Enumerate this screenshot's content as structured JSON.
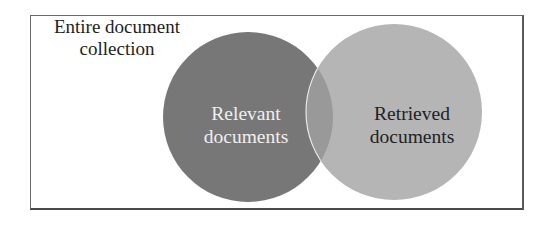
{
  "diagram": {
    "type": "venn",
    "title": "",
    "frame": {
      "label_line1": "Entire document",
      "label_line2": "collection"
    },
    "sets": [
      {
        "id": "relevant",
        "label_line1": "Relevant",
        "label_line2": "documents",
        "fill": "#777777",
        "text_color": "#efefef"
      },
      {
        "id": "retrieved",
        "label_line1": "Retrieved",
        "label_line2": "documents",
        "fill": "#b5b5b5",
        "text_color": "#222222"
      }
    ],
    "intersection": {
      "fill": "#999999",
      "outline": "#e8e8e8"
    },
    "frame_border_color": "#5a5a5a"
  }
}
